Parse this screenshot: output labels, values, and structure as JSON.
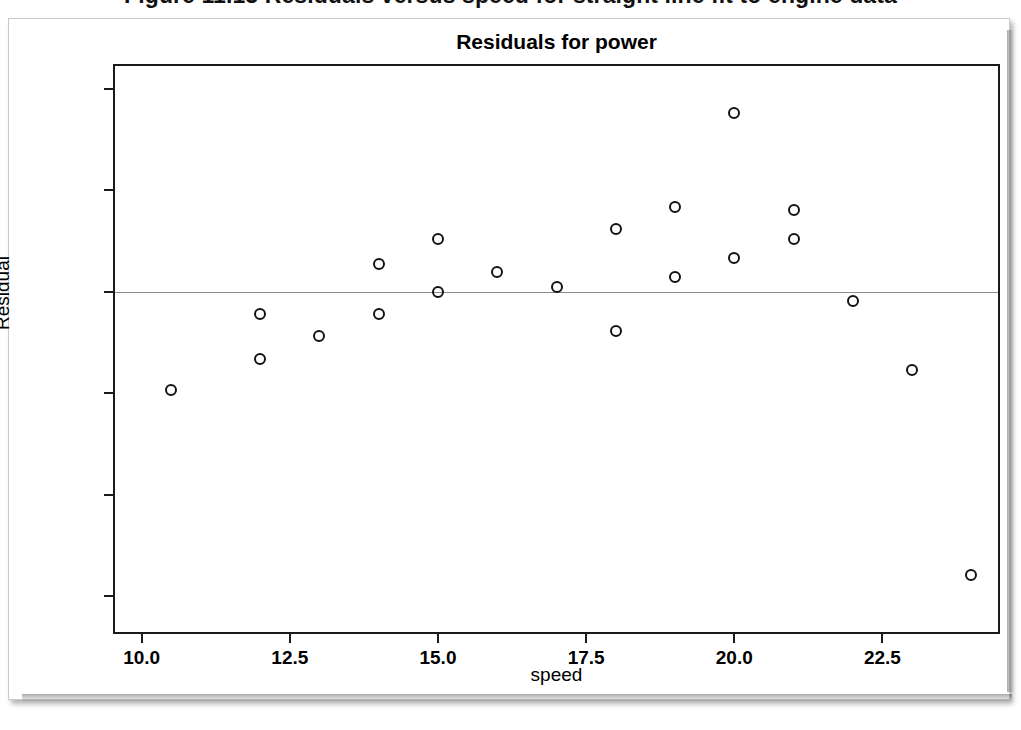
{
  "page": {
    "figure_caption": "Figure 11.13  Residuals versus speed for straight line fit to engine data"
  },
  "chart_data": {
    "type": "scatter",
    "title": "Residuals for power",
    "xlabel": "speed",
    "ylabel": "Residual",
    "xlim": [
      9.55,
      24.45
    ],
    "ylim": [
      -6.7,
      4.45
    ],
    "xticks": [
      "10.0",
      "12.5",
      "15.0",
      "17.5",
      "20.0",
      "22.5"
    ],
    "xtick_values": [
      10.0,
      12.5,
      15.0,
      17.5,
      20.0,
      22.5
    ],
    "yticks": [
      "4",
      "2",
      "0",
      "-2",
      "-4",
      "-6"
    ],
    "ytick_values": [
      4,
      2,
      0,
      -2,
      -4,
      -6
    ],
    "grid": false,
    "legend": null,
    "reference_line": {
      "axis": "y",
      "value": 0,
      "color": "#8d8d8d"
    },
    "marker": {
      "shape": "open-circle",
      "color": "#131313",
      "size": 12
    },
    "points": [
      {
        "x": 10.5,
        "y": -1.93
      },
      {
        "x": 12.0,
        "y": -0.44
      },
      {
        "x": 12.0,
        "y": -1.32
      },
      {
        "x": 13.0,
        "y": -0.87
      },
      {
        "x": 14.0,
        "y": 0.55
      },
      {
        "x": 14.0,
        "y": -0.44
      },
      {
        "x": 15.0,
        "y": 1.04
      },
      {
        "x": 15.0,
        "y": 0.0
      },
      {
        "x": 16.0,
        "y": 0.4
      },
      {
        "x": 17.0,
        "y": 0.1
      },
      {
        "x": 18.0,
        "y": 1.24
      },
      {
        "x": 18.0,
        "y": -0.78
      },
      {
        "x": 19.0,
        "y": 1.68
      },
      {
        "x": 19.0,
        "y": 0.3
      },
      {
        "x": 20.0,
        "y": 3.52
      },
      {
        "x": 20.0,
        "y": 0.67
      },
      {
        "x": 21.0,
        "y": 1.61
      },
      {
        "x": 21.0,
        "y": 1.04
      },
      {
        "x": 22.0,
        "y": -0.18
      },
      {
        "x": 23.0,
        "y": -1.54
      },
      {
        "x": 24.0,
        "y": -5.58
      }
    ]
  }
}
